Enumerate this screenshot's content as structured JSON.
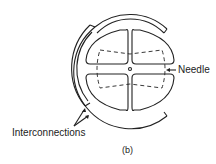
{
  "labels": {
    "needle": "Needle",
    "interconnections": "Interconnections",
    "caption": "(b)"
  },
  "colors": {
    "stroke": "#222222",
    "background": "#ffffff"
  }
}
